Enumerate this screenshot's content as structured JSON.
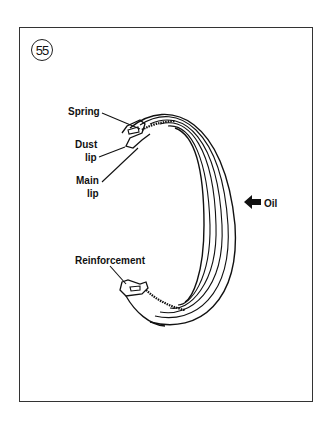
{
  "figure": {
    "number": "55",
    "labels": {
      "spring": "Spring",
      "dust_lip_1": "Dust",
      "dust_lip_2": "lip",
      "main_lip_1": "Main",
      "main_lip_2": "lip",
      "reinforcement": "Reinforcement",
      "oil": "Oil"
    },
    "line_color": "#111111",
    "frame_color": "#333333"
  }
}
